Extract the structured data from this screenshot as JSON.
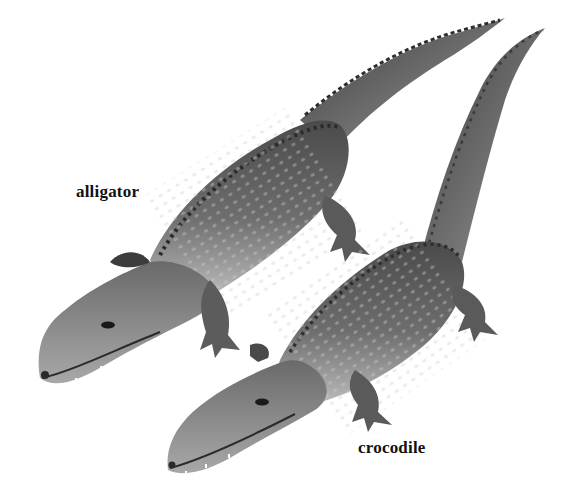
{
  "figure": {
    "background": "#ffffff",
    "labels": {
      "alligator": "alligator",
      "crocodile": "crocodile"
    },
    "subjects": [
      {
        "name": "alligator",
        "position": "upper-left, snout pointing lower-left, tail curving to upper-right"
      },
      {
        "name": "crocodile",
        "position": "lower-right, snout pointing lower-left, tail rising to top-right"
      }
    ],
    "palette": {
      "dark": "#3a3a3a",
      "mid": "#7a7a7a",
      "light": "#b8b8b8",
      "belly": "#d6d6d6"
    }
  }
}
